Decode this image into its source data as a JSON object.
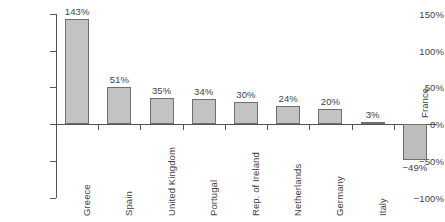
{
  "chart_data": {
    "type": "bar",
    "title": "",
    "xlabel": "",
    "ylabel": "",
    "ylim": [
      -100,
      150
    ],
    "grid": false,
    "legend": "none",
    "orientation": "vertical",
    "ytick_labels": [
      "150%",
      "100%",
      "50%",
      "0%",
      "-50%",
      "-100%"
    ],
    "ytick_values": [
      150,
      100,
      50,
      0,
      -50,
      -100
    ],
    "categories": [
      "Greece",
      "Spain",
      "United Kingdom",
      "Portugal",
      "Rep. of Ireland",
      "Netherlands",
      "Germany",
      "Italy",
      "France"
    ],
    "values": [
      143,
      51,
      35,
      34,
      30,
      24,
      20,
      3,
      -49
    ],
    "value_labels": [
      "143%",
      "51%",
      "35%",
      "34%",
      "30%",
      "24%",
      "20%",
      "3%",
      "-49%"
    ],
    "bar_fill": "#c3c3c3",
    "bar_edge": "#6f6f6f",
    "axis_color": "#555555",
    "text_color": "#3f3f3f"
  }
}
